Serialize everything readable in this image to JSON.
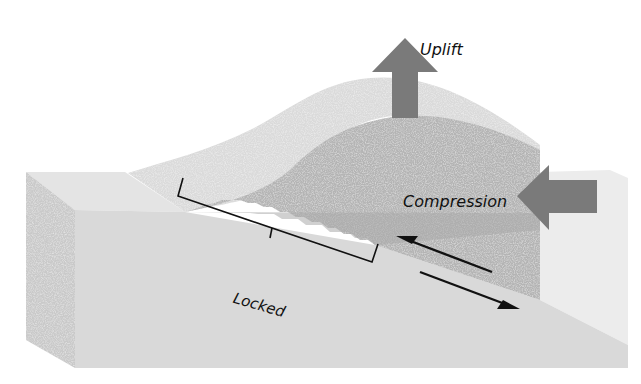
{
  "diagram": {
    "labels": {
      "uplift": "Uplift",
      "compression": "Compression",
      "locked": "Locked"
    },
    "colors": {
      "background": "#ffffff",
      "block_side": "#c9c9c9",
      "block_front": "#d9d9d9",
      "block_top": "#e4e4e4",
      "hanging_wall_surface": "#d2d2d2",
      "hanging_wall_front": "#b4b4b4",
      "arrow_fill": "#7a7a7a",
      "slip_arrow": "#111111",
      "bracket": "#111111"
    },
    "arrows": [
      {
        "name": "uplift",
        "direction": "up"
      },
      {
        "name": "compression",
        "direction": "left"
      },
      {
        "name": "hanging-wall-slip",
        "direction": "up-left"
      },
      {
        "name": "footwall-slip",
        "direction": "down-right"
      }
    ]
  }
}
